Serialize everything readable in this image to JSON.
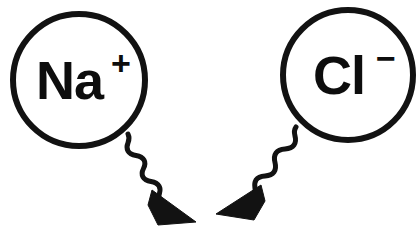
{
  "figure": {
    "background_color": "#ffffff",
    "ink_color": "#121212",
    "width": 418,
    "height": 238
  },
  "ions": [
    {
      "id": "sodium",
      "symbol": "Na",
      "charge": "+",
      "full_label": "Na+",
      "circle": {
        "cx": 79,
        "cy": 80,
        "r": 66,
        "stroke_width": 6,
        "fill": "#ffffff",
        "stroke": "#121212"
      },
      "symbol_x": 36,
      "symbol_y": 99,
      "charge_x": 111,
      "charge_y": 75
    },
    {
      "id": "chloride",
      "symbol": "Cl",
      "charge": "−",
      "full_label": "Cl−",
      "circle": {
        "cx": 348,
        "cy": 75,
        "r": 65,
        "stroke_width": 6,
        "fill": "#ffffff",
        "stroke": "#121212"
      },
      "symbol_x": 313,
      "symbol_y": 94,
      "charge_x": 376,
      "charge_y": 70
    }
  ],
  "arrows": [
    {
      "id": "sodium-attraction-arrow",
      "from": "sodium",
      "direction": "down-right",
      "stroke_width": 5,
      "path": "M 128,134 C 132,142 124,144 128,151 C 132,158 140,153 144,160 C 148,167 139,170 143,177 C 147,184 155,179 159,186 C 162,191 158,194 159,198",
      "arrowhead_points": "152,190 196,222 158,225 148,205"
    },
    {
      "id": "chloride-attraction-arrow",
      "from": "chloride",
      "direction": "down-left",
      "stroke_width": 5,
      "path": "M 296,127 C 291,134 299,138 294,145 C 289,152 281,146 276,153 C 271,160 279,165 274,172 C 269,179 261,173 256,180 C 253,185 256,188 255,192",
      "arrowhead_points": "261,185 216,214 254,220 265,201"
    }
  ],
  "semantics": {
    "description": "Ionic attraction diagram: sodium cation and chloride anion with wavy arrows converging",
    "converge_point_x": 207,
    "converge_point_y": 216
  }
}
